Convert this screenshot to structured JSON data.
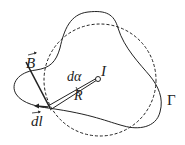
{
  "diagram": {
    "labels": {
      "B": "B",
      "dl": "dl",
      "d_alpha": "dα",
      "current": "I",
      "radius": "R",
      "contour": "Γ"
    },
    "colors": {
      "stroke": "#222222",
      "background": "#ffffff"
    }
  }
}
